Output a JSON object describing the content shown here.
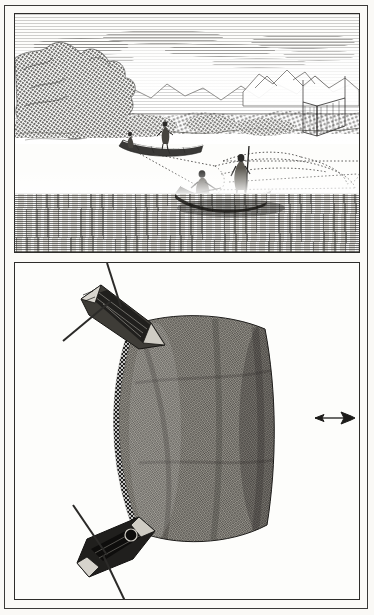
{
  "plate": {
    "domain": "historical-engraving",
    "subject": "Trawl net fishing with two boats",
    "panel_count": 2,
    "paper_color": "#faf9f6",
    "ink_color": "#2b2a28",
    "border_color": "#2e2d2b"
  },
  "top_panel": {
    "name": "perspective-fishing-scene",
    "caption": "",
    "sky": {
      "label": "engraved cloud bands",
      "cloud_count": 7
    },
    "landscape": {
      "left_trees_label": "wooded bank with dense foliage",
      "distant_mountains_label": "distant hills and rocky peaks",
      "right_structure_label": "shore weir posts"
    },
    "water": {
      "label": "rippled water",
      "color": "#d8d6d1"
    },
    "boats": [
      {
        "id": "far-boat",
        "label": "far canoe",
        "figures": 2,
        "figure_poses": [
          "standing poler",
          "standing crew"
        ]
      },
      {
        "id": "near-boat",
        "label": "near canoe",
        "figures": 2,
        "figure_poses": [
          "seated rower",
          "standing poler with pole"
        ]
      }
    ],
    "net": {
      "label": "submerged trawl net outlined with dotted tow ropes",
      "line_style": "dotted"
    }
  },
  "bottom_panel": {
    "name": "overhead-net-diagram",
    "caption": "",
    "net": {
      "label": "trawl net bag seen from above",
      "mesh_label": "knotted mesh netting",
      "cork_line_label": "beaded cork line"
    },
    "boats": [
      {
        "id": "upper-boat",
        "label": "towing boat, upper",
        "oars": 2
      },
      {
        "id": "lower-boat",
        "label": "towing boat, lower",
        "oars": 2
      }
    ],
    "direction_arrow": {
      "label": "direction of travel arrow",
      "points": "left"
    }
  }
}
